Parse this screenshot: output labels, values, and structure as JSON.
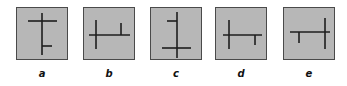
{
  "figure": {
    "box_fill": "#b7b7b7",
    "box_border": "#4a4a4a",
    "line_color": "#1e1e1e",
    "options": [
      {
        "label": "a",
        "left": 16,
        "segments": [
          {
            "x1": 11,
            "y1": 13,
            "x2": 40,
            "y2": 13
          },
          {
            "x1": 25,
            "y1": 5,
            "x2": 25,
            "y2": 47
          },
          {
            "x1": 25,
            "y1": 38,
            "x2": 35,
            "y2": 38
          }
        ]
      },
      {
        "label": "b",
        "left": 83,
        "segments": [
          {
            "x1": 5,
            "y1": 27,
            "x2": 46,
            "y2": 27
          },
          {
            "x1": 12,
            "y1": 12,
            "x2": 12,
            "y2": 41
          },
          {
            "x1": 37,
            "y1": 15,
            "x2": 37,
            "y2": 27
          }
        ]
      },
      {
        "label": "c",
        "left": 150,
        "segments": [
          {
            "x1": 26,
            "y1": 4,
            "x2": 26,
            "y2": 50
          },
          {
            "x1": 16,
            "y1": 13,
            "x2": 26,
            "y2": 13
          },
          {
            "x1": 11,
            "y1": 40,
            "x2": 40,
            "y2": 40
          }
        ]
      },
      {
        "label": "d",
        "left": 215,
        "segments": [
          {
            "x1": 7,
            "y1": 27,
            "x2": 46,
            "y2": 27
          },
          {
            "x1": 13,
            "y1": 12,
            "x2": 13,
            "y2": 41
          },
          {
            "x1": 39,
            "y1": 27,
            "x2": 39,
            "y2": 37
          }
        ]
      },
      {
        "label": "e",
        "left": 283,
        "segments": [
          {
            "x1": 6,
            "y1": 24,
            "x2": 46,
            "y2": 24
          },
          {
            "x1": 41,
            "y1": 10,
            "x2": 41,
            "y2": 41
          },
          {
            "x1": 15,
            "y1": 24,
            "x2": 15,
            "y2": 35
          }
        ]
      }
    ]
  }
}
